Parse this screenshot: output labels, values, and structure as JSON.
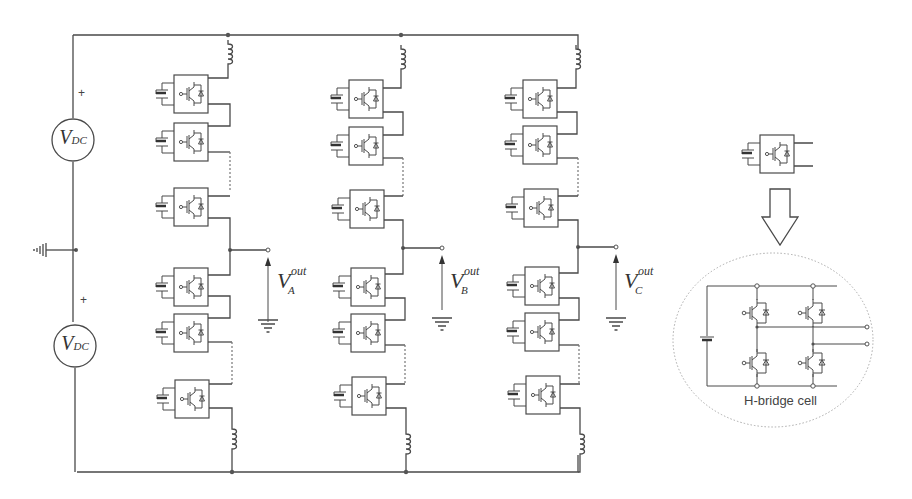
{
  "diagram": {
    "sources": [
      {
        "id": "vdc-top",
        "label": "V",
        "subscript": "DC",
        "polarity": "+"
      },
      {
        "id": "vdc-bottom",
        "label": "V",
        "subscript": "DC",
        "polarity": "+"
      }
    ],
    "phases": [
      {
        "id": "A",
        "label": "V",
        "superscript": "out",
        "subscript": "A",
        "x": 232
      },
      {
        "id": "B",
        "label": "V",
        "superscript": "out",
        "subscript": "B",
        "x": 403
      },
      {
        "id": "C",
        "label": "V",
        "superscript": "out",
        "subscript": "C",
        "x": 578
      }
    ],
    "arm_modules_per_arm": 3,
    "arms_per_phase": [
      "upper",
      "lower"
    ],
    "components": [
      "DC source",
      "inductor",
      "H-bridge submodule",
      "ground",
      "output terminal"
    ],
    "detail": {
      "caption": "H-bridge cell",
      "switches": 4,
      "arrow": "down"
    },
    "colors": {
      "line": "#4a4a4a",
      "ellipse": "#aaaaaa"
    }
  }
}
